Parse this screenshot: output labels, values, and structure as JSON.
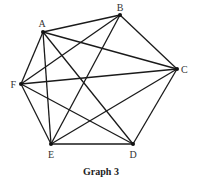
{
  "caption": "Graph 3",
  "colors": {
    "edge": "#1a1a1a",
    "vertex": "#111111",
    "label": "#333333"
  },
  "vertices": [
    {
      "id": "A",
      "x": 43,
      "y": 32,
      "label": "A",
      "lx": 42,
      "ly": 27,
      "anchor": "middle"
    },
    {
      "id": "B",
      "x": 120,
      "y": 15,
      "label": "B",
      "lx": 120,
      "ly": 11,
      "anchor": "middle"
    },
    {
      "id": "C",
      "x": 177,
      "y": 69,
      "label": "C",
      "lx": 181,
      "ly": 73,
      "anchor": "start"
    },
    {
      "id": "D",
      "x": 133,
      "y": 144,
      "label": "D",
      "lx": 133,
      "ly": 158,
      "anchor": "middle"
    },
    {
      "id": "E",
      "x": 51,
      "y": 144,
      "label": "E",
      "lx": 51,
      "ly": 158,
      "anchor": "middle"
    },
    {
      "id": "F",
      "x": 21,
      "y": 84,
      "label": "F",
      "lx": 16,
      "ly": 88,
      "anchor": "end"
    }
  ],
  "edges": [
    [
      "A",
      "B"
    ],
    [
      "A",
      "C"
    ],
    [
      "A",
      "F"
    ],
    [
      "A",
      "E"
    ],
    [
      "A",
      "D"
    ],
    [
      "B",
      "F"
    ],
    [
      "B",
      "E"
    ],
    [
      "B",
      "C"
    ],
    [
      "C",
      "F"
    ],
    [
      "C",
      "E"
    ],
    [
      "C",
      "D"
    ],
    [
      "F",
      "E"
    ],
    [
      "F",
      "D"
    ],
    [
      "E",
      "D"
    ]
  ]
}
